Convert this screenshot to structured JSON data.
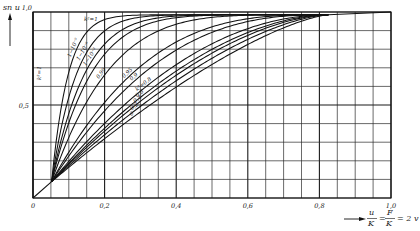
{
  "chart_data": {
    "type": "line",
    "title": "",
    "ylabel": "sn u",
    "xlabel": "u/K = F/K = 2v",
    "xlabel_parts": {
      "num1": "u",
      "den1": "K",
      "eq1": "=",
      "num2": "F",
      "den2": "K",
      "rhs": "= 2 v"
    },
    "xlim": [
      0,
      1.0
    ],
    "ylim": [
      0,
      1.0
    ],
    "grid": true,
    "x_grid_step": 0.05,
    "y_grid_step": 0.1,
    "x_ticks": [
      {
        "value": 0.0,
        "label": "0"
      },
      {
        "value": 0.2,
        "label": "0,2"
      },
      {
        "value": 0.4,
        "label": "0,4"
      },
      {
        "value": 0.6,
        "label": "0,6"
      },
      {
        "value": 0.8,
        "label": "0,8"
      },
      {
        "value": 1.0,
        "label": "1,0"
      }
    ],
    "y_ticks": [
      {
        "value": 0.5,
        "label": "0,5"
      },
      {
        "value": 1.0,
        "label": "1,0"
      }
    ],
    "limit_curve": {
      "name": "k²=1",
      "label_top": "k²=1",
      "label_axis": "k²=1"
    },
    "fan_start": [
      0.052,
      0.088
    ],
    "fan_end": [
      0.825,
      0.985
    ],
    "end_point": [
      1.0,
      1.0
    ],
    "series": [
      {
        "name": "k² = 1−10⁻⁹",
        "label": "1−10⁻⁹",
        "x_at_y_half": 0.08
      },
      {
        "name": "k² = 1−10⁻⁶",
        "label": "1−10⁻⁶",
        "x_at_y_half": 0.094
      },
      {
        "name": "k² = 1−10⁻³",
        "label": "1−10⁻³",
        "x_at_y_half": 0.108
      },
      {
        "name": "k² (unlabeled)",
        "label": "",
        "x_at_y_half": 0.119
      },
      {
        "name": "k² = 0,99",
        "label": "0,99",
        "x_at_y_half": 0.145
      },
      {
        "name": "k² = 0,95",
        "label": "0,95",
        "x_at_y_half": 0.194
      },
      {
        "name": "k² = 0,9",
        "label": "0,9",
        "x_at_y_half": 0.215
      },
      {
        "name": "k² = 0,8",
        "label": "k²=0,8",
        "x_at_y_half": 0.255
      },
      {
        "name": "k² = 0,6",
        "label": "0,6",
        "x_at_y_half": 0.274
      },
      {
        "name": "k² = 0,4",
        "label": "0,4",
        "x_at_y_half": 0.287
      },
      {
        "name": "k² = 0,2",
        "label": "0,2",
        "x_at_y_half": 0.305
      },
      {
        "name": "k² = 0",
        "label": "0",
        "x_at_y_half": 0.327
      }
    ]
  }
}
